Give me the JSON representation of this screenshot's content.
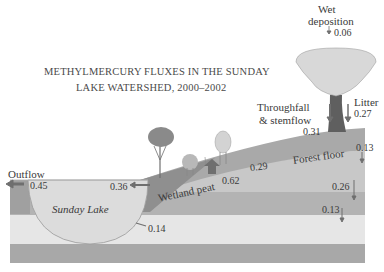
{
  "title": {
    "line1": "METHYLMERCURY FLUXES IN THE SUNDAY",
    "line2": "LAKE WATERSHED, 2000–2002"
  },
  "labels": {
    "wet_deposition_1": "Wet",
    "wet_deposition_2": "deposition",
    "throughfall_1": "Throughfall",
    "throughfall_2": "& stemflow",
    "litter": "Litter",
    "outflow": "Outflow",
    "sunday_lake": "Sunday Lake",
    "wetland_peat": "Wetland peat",
    "forest_floor": "Forest floor"
  },
  "fluxes": {
    "wet_deposition": "0.06",
    "throughfall": "0.31",
    "litter": "0.27",
    "outflow": "0.45",
    "wetland_to_lake": "0.36",
    "lake_sediment": "0.14",
    "wetland_peat_up": "0.62",
    "forest_to_wetland": "0.29",
    "forest_floor_down": "0.13",
    "soil_mid_down": "0.26",
    "soil_deep_down": "0.13"
  },
  "colors": {
    "layer_top": "#a8a8a8",
    "layer_mid": "#c4c4c4",
    "layer_light": "#e4e4e4",
    "layer_bottom": "#a6a6a6",
    "lake": "#dcdcdc",
    "tree_crown": "#d6d6d6",
    "trunk": "#606060",
    "arrow": "#6f6f6f"
  }
}
